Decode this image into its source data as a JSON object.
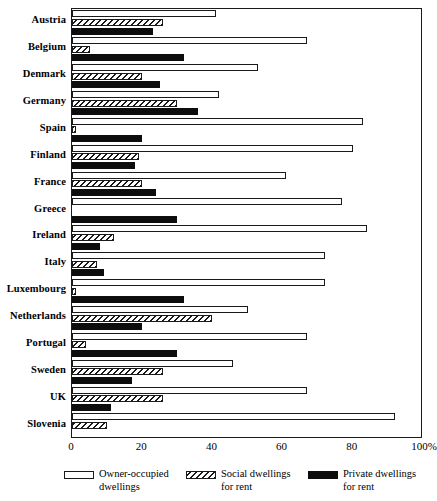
{
  "chart_data": {
    "type": "bar",
    "orientation": "horizontal",
    "title": "",
    "xlabel": "",
    "ylabel": "",
    "xlim": [
      0,
      100
    ],
    "xticks": [
      {
        "value": 0,
        "label": "0"
      },
      {
        "value": 20,
        "label": "20"
      },
      {
        "value": 40,
        "label": "40"
      },
      {
        "value": 60,
        "label": "60"
      },
      {
        "value": 80,
        "label": "80"
      },
      {
        "value": 100,
        "label": "100%"
      }
    ],
    "grid": false,
    "legend_position": "bottom",
    "categories": [
      "Austria",
      "Belgium",
      "Denmark",
      "Germany",
      "Spain",
      "Finland",
      "France",
      "Greece",
      "Ireland",
      "Italy",
      "Luxembourg",
      "Netherlands",
      "Portugal",
      "Sweden",
      "UK",
      "Slovenia"
    ],
    "series": [
      {
        "name": "Owner-occupied\ndwellings",
        "key": "owner",
        "style": "white-outline",
        "values": [
          41,
          67,
          53,
          42,
          83,
          80,
          61,
          77,
          84,
          72,
          72,
          50,
          67,
          46,
          67,
          92
        ]
      },
      {
        "name": "Social dwellings\nfor rent",
        "key": "social",
        "style": "hatched",
        "values": [
          26,
          5,
          20,
          30,
          1,
          19,
          20,
          0,
          12,
          7,
          1,
          40,
          4,
          26,
          26,
          10
        ]
      },
      {
        "name": "Private dwellings\nfor rent",
        "key": "private",
        "style": "solid-black",
        "values": [
          23,
          32,
          25,
          36,
          20,
          18,
          24,
          30,
          8,
          9,
          32,
          20,
          30,
          17,
          11,
          0
        ]
      }
    ]
  },
  "legend": {
    "items": [
      {
        "label": "Owner-occupied\ndwellings",
        "swatch": "white-outline-swatch"
      },
      {
        "label": "Social dwellings\nfor rent",
        "swatch": "hatched-swatch"
      },
      {
        "label": "Private dwellings\nfor rent",
        "swatch": "black-swatch"
      }
    ]
  },
  "colors": {
    "outline": "#1a1a1a",
    "fill_white": "#ffffff",
    "fill_black": "#0d0d0d",
    "background": "#ffffff"
  }
}
